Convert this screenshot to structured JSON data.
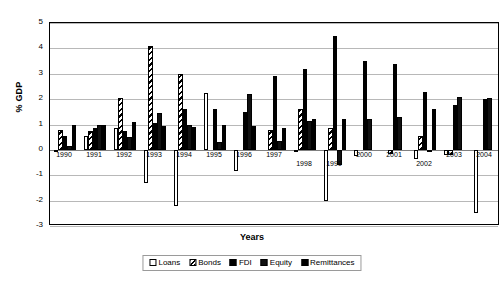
{
  "chart_data": {
    "type": "bar",
    "title": "",
    "xlabel": "Years",
    "ylabel": "% GDP",
    "ylim": [
      -3,
      5
    ],
    "yticks": [
      5,
      4,
      3,
      2,
      1,
      0,
      -1,
      -2,
      -3
    ],
    "grid": true,
    "legend_position": "bottom",
    "categories": [
      "1990",
      "1991",
      "1992",
      "1993",
      "1994",
      "1995",
      "1996",
      "1997",
      "1998",
      "1999",
      "2000",
      "2001",
      "2002",
      "2003",
      "2004"
    ],
    "series": [
      {
        "name": "Loans",
        "values": [
          -0.05,
          0.55,
          0.85,
          -1.3,
          -2.2,
          2.25,
          -0.85,
          0.0,
          -0.1,
          -2.0,
          -0.25,
          0.0,
          -0.35,
          -0.2,
          -2.5
        ]
      },
      {
        "name": "Bonds",
        "values": [
          0.8,
          0.75,
          2.05,
          4.1,
          3.0,
          0.0,
          0.0,
          0.8,
          1.6,
          0.85,
          0.0,
          -0.15,
          0.55,
          -0.2,
          0.0
        ]
      },
      {
        "name": "FDI",
        "values": [
          0.55,
          0.85,
          0.75,
          1.05,
          1.6,
          1.6,
          1.5,
          2.9,
          3.2,
          4.5,
          3.5,
          3.4,
          2.3,
          1.75,
          2.0
        ]
      },
      {
        "name": "Equity",
        "values": [
          0.15,
          1.0,
          0.5,
          1.45,
          1.0,
          0.3,
          2.2,
          0.35,
          1.15,
          -0.6,
          1.2,
          1.3,
          -0.05,
          2.1,
          2.05
        ]
      },
      {
        "name": "Remittances",
        "values": [
          1.0,
          1.0,
          1.1,
          0.95,
          0.9,
          1.0,
          0.95,
          0.85,
          1.2,
          1.2,
          0.0,
          0.0,
          1.6,
          0.0,
          0.0
        ]
      }
    ],
    "legend": [
      "Loans",
      "Bonds",
      "FDI",
      "Equity",
      "Remittances"
    ]
  },
  "legend": {
    "loans": "Loans",
    "bonds": "Bonds",
    "fdi": "FDI",
    "equity": "Equity",
    "remittances": "Remittances"
  },
  "axes": {
    "y_title": "% GDP",
    "x_title": "Years"
  }
}
